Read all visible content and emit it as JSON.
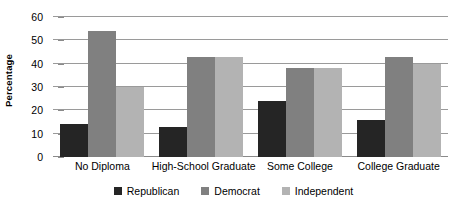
{
  "chart_data": {
    "type": "bar",
    "title": "",
    "subtitle": "",
    "xlabel": "",
    "ylabel": "Percentage",
    "ylim": [
      0,
      60
    ],
    "yticks": [
      0,
      10,
      20,
      30,
      40,
      50,
      60
    ],
    "ytick_labels": [
      "0",
      "10",
      "20",
      "30",
      "40",
      "50",
      "60"
    ],
    "grid": true,
    "grid_axis": "y",
    "legend_position": "bottom-center",
    "orientation": "vertical",
    "grouping": "clustered",
    "categories": [
      "No Diploma",
      "High-School Graduate",
      "Some College",
      "College Graduate"
    ],
    "series": [
      {
        "name": "Republican",
        "color": "#252525",
        "values": [
          14,
          13,
          24,
          16
        ]
      },
      {
        "name": "Democrat",
        "color": "#808080",
        "values": [
          54,
          43,
          38,
          43
        ]
      },
      {
        "name": "Independent",
        "color": "#b3b3b3",
        "values": [
          30,
          43,
          38,
          40
        ]
      }
    ]
  },
  "axes": {
    "y_title": "Percentage"
  },
  "colors": {
    "background": "#ffffff",
    "gridline": "#9a9a9a",
    "axis": "#8a8a8a",
    "text": "#000000"
  }
}
